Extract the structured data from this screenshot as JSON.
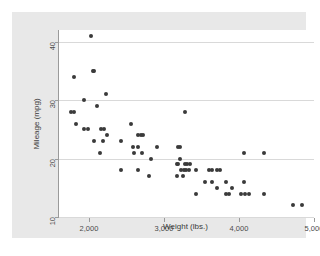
{
  "chart_data": {
    "type": "scatter",
    "title": "",
    "xlabel": "Weight (lbs.)",
    "ylabel": "Mileage (mpg)",
    "xlim": [
      1600,
      5000
    ],
    "ylim": [
      10,
      42
    ],
    "xticks": [
      2000,
      3000,
      4000,
      5000
    ],
    "xticklabels": [
      "2,000",
      "3,000",
      "4,000",
      "5,000"
    ],
    "yticks": [
      10,
      20,
      30,
      40
    ],
    "yticklabels": [
      "10",
      "20",
      "30",
      "40"
    ],
    "grid": "horizontal",
    "legend": "none",
    "marker": {
      "shape": "circle",
      "color": "#3a3a3a",
      "size": 4
    },
    "series": [
      {
        "name": "cars",
        "points": [
          [
            2020,
            41
          ],
          [
            2050,
            35
          ],
          [
            2070,
            35
          ],
          [
            1800,
            34
          ],
          [
            1930,
            30
          ],
          [
            2230,
            31
          ],
          [
            2110,
            29
          ],
          [
            1760,
            28
          ],
          [
            1800,
            28
          ],
          [
            3280,
            28
          ],
          [
            1830,
            26
          ],
          [
            2560,
            26
          ],
          [
            1930,
            25
          ],
          [
            1990,
            25
          ],
          [
            2160,
            25
          ],
          [
            2200,
            25
          ],
          [
            2240,
            24
          ],
          [
            2650,
            24
          ],
          [
            2690,
            24
          ],
          [
            2720,
            24
          ],
          [
            2070,
            23
          ],
          [
            2180,
            23
          ],
          [
            2430,
            23
          ],
          [
            2590,
            22
          ],
          [
            2650,
            22
          ],
          [
            2900,
            22
          ],
          [
            3180,
            22
          ],
          [
            3210,
            22
          ],
          [
            2140,
            21
          ],
          [
            2600,
            21
          ],
          [
            2710,
            21
          ],
          [
            2830,
            20
          ],
          [
            3210,
            20
          ],
          [
            3170,
            19
          ],
          [
            3190,
            19
          ],
          [
            3280,
            19
          ],
          [
            3310,
            19
          ],
          [
            3340,
            19
          ],
          [
            3230,
            18
          ],
          [
            3260,
            18
          ],
          [
            3290,
            18
          ],
          [
            3330,
            18
          ],
          [
            3430,
            18
          ],
          [
            3600,
            18
          ],
          [
            3640,
            18
          ],
          [
            3700,
            18
          ],
          [
            3740,
            18
          ],
          [
            2430,
            18
          ],
          [
            2650,
            18
          ],
          [
            2800,
            17
          ],
          [
            3170,
            17
          ],
          [
            3250,
            17
          ],
          [
            3550,
            16
          ],
          [
            3640,
            16
          ],
          [
            3830,
            16
          ],
          [
            4060,
            16
          ],
          [
            3700,
            15
          ],
          [
            3900,
            15
          ],
          [
            3430,
            14
          ],
          [
            3830,
            14
          ],
          [
            3870,
            14
          ],
          [
            4030,
            14
          ],
          [
            4080,
            14
          ],
          [
            4130,
            14
          ],
          [
            4330,
            14
          ],
          [
            4060,
            21
          ],
          [
            4330,
            21
          ],
          [
            4720,
            12
          ],
          [
            4840,
            12
          ]
        ]
      }
    ]
  },
  "axes": {
    "y_title": "Mileage (mpg)",
    "x_title": "Weight (lbs.)"
  }
}
